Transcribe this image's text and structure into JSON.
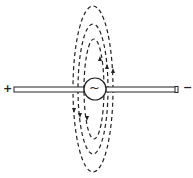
{
  "diagram": {
    "type": "dipole-antenna-field",
    "labels": {
      "positive_terminal": "+",
      "negative_terminal": "−",
      "source_symbol": "~"
    },
    "components": [
      {
        "name": "rod-left",
        "description": "left conductor of dipole (positive end)"
      },
      {
        "name": "ac-source",
        "description": "circle with alternating current symbol at center"
      },
      {
        "name": "rod-right",
        "description": "right conductor of dipole (negative end)"
      }
    ],
    "field_lines": [
      {
        "name": "outer",
        "style": "dashed",
        "shape": "ellipse",
        "rx": 20,
        "ry": 83
      },
      {
        "name": "middle",
        "style": "dashed",
        "shape": "ellipse",
        "rx": 15,
        "ry": 65
      },
      {
        "name": "inner",
        "style": "dashed",
        "shape": "ellipse",
        "rx": 10,
        "ry": 50
      }
    ],
    "arrows": {
      "right_side": "up",
      "left_side": "down"
    },
    "colors": {
      "line": "#222222",
      "background": "#ffffff"
    }
  }
}
